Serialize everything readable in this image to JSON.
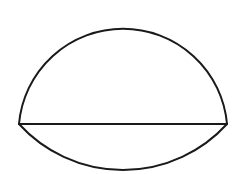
{
  "diagram": {
    "type": "geometric-figure",
    "stroke_color": "#1a1a1a",
    "background_color": "#ffffff",
    "chord": {
      "x1": 19,
      "y1": 124,
      "x2": 227,
      "y2": 124
    },
    "upper_arc": {
      "from": [
        19,
        124
      ],
      "to": [
        227,
        124
      ],
      "radius": 104.4,
      "apex": [
        123,
        10
      ]
    },
    "lower_arc": {
      "from": [
        19,
        124
      ],
      "to": [
        227,
        124
      ],
      "radius": 140.6,
      "bottom": [
        123,
        170
      ]
    }
  }
}
